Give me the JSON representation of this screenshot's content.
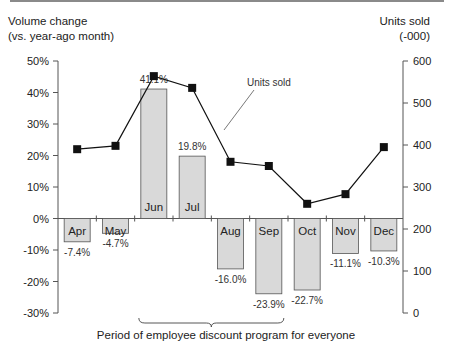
{
  "chart_data": {
    "type": "bar+line",
    "categories": [
      "Apr",
      "May",
      "Jun",
      "Jul",
      "Aug",
      "Sep",
      "Oct",
      "Nov",
      "Dec"
    ],
    "series": [
      {
        "name": "Volume change (vs. year-ago month)",
        "type": "bar",
        "axis": "left",
        "unit": "%",
        "values": [
          -7.4,
          -4.7,
          41.1,
          19.8,
          -16.0,
          -23.9,
          -22.7,
          -11.1,
          -10.3
        ],
        "labels": [
          "-7.4%",
          "-4.7%",
          "41.1%",
          "19.8%",
          "-16.0%",
          "-23.9%",
          "-22.7%",
          "-11.1%",
          "-10.3%"
        ]
      },
      {
        "name": "Units sold",
        "type": "line",
        "axis": "right",
        "unit": "-000",
        "values": [
          390,
          398,
          564,
          536,
          360,
          350,
          260,
          283,
          395
        ]
      }
    ],
    "left_axis": {
      "title_line1": "Volume change",
      "title_line2": "(vs. year-ago month)",
      "ylim": [
        -30,
        50
      ],
      "ticks": [
        "50%",
        "40%",
        "30%",
        "20%",
        "10%",
        "0%",
        "-10%",
        "-20%",
        "-30%"
      ]
    },
    "right_axis": {
      "title_line1": "Units sold",
      "title_line2": "(-000)",
      "ylim": [
        0,
        600
      ],
      "ticks": [
        "600",
        "500",
        "400",
        "300",
        "200",
        "100",
        "0"
      ]
    },
    "annotations": {
      "line_label": "Units sold",
      "brace_label": "Period of employee discount program for everyone",
      "brace_span": [
        "Jun",
        "Sep"
      ]
    },
    "colors": {
      "bar_fill": "#d9d9d9",
      "bar_stroke": "#555555",
      "line": "#111111",
      "axis": "#555555"
    },
    "grid": false
  }
}
